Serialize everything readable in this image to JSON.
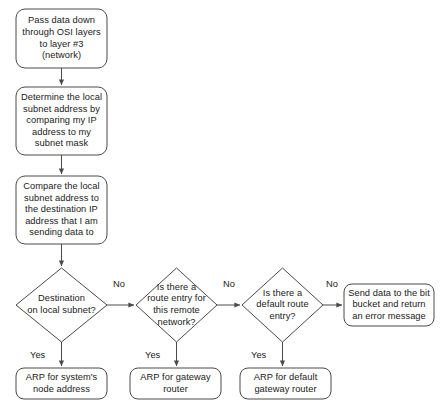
{
  "diagram": {
    "title_text": "",
    "type": "flowchart",
    "background_color": "#ffffff",
    "stroke_color": "#4a4a4a",
    "text_color": "#1a1a1a",
    "nodes": [
      {
        "id": "pass-data-down",
        "shape": "rounded-rect",
        "text": "Pass data down\nthrough OSI layers\nto layer #3\n(network)"
      },
      {
        "id": "determine-local-subnet",
        "shape": "rounded-rect",
        "text": "Determine the local\nsubnet address by\ncomparing my IP\naddress to my\nsubnet mask"
      },
      {
        "id": "compare-subnet-destination",
        "shape": "rounded-rect",
        "text": "Compare the local\nsubnet address to\nthe destination IP\naddress that I am\nsending data to"
      },
      {
        "id": "destination-on-local-subnet",
        "shape": "diamond",
        "text": "Destination\non local subnet?"
      },
      {
        "id": "route-entry-remote-network",
        "shape": "diamond",
        "text": "Is there a\nroute entry for\nthis remote\nnetwork?"
      },
      {
        "id": "default-route-entry",
        "shape": "diamond",
        "text": "Is there a\ndefault route\nentry?"
      },
      {
        "id": "send-to-bit-bucket",
        "shape": "rounded-rect",
        "text": "Send data to the bit\nbucket and return\nan error message"
      },
      {
        "id": "arp-system-node-address",
        "shape": "rounded-rect",
        "text": "ARP for system's\nnode address"
      },
      {
        "id": "arp-gateway-router",
        "shape": "rounded-rect",
        "text": "ARP for gateway\nrouter"
      },
      {
        "id": "arp-default-gateway-router",
        "shape": "rounded-rect",
        "text": "ARP for default\ngateway router"
      }
    ],
    "edge_labels": {
      "no_1": "No",
      "no_2": "No",
      "no_3": "No",
      "yes_1": "Yes",
      "yes_2": "Yes",
      "yes_3": "Yes"
    }
  }
}
